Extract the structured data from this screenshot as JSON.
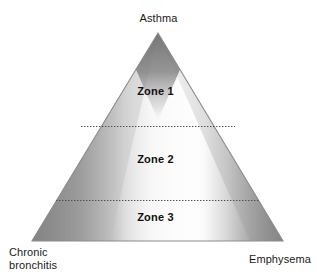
{
  "figure": {
    "shape": "triangle",
    "background_color": "#ffffff",
    "outline_color": "#8c8c8c",
    "divider_style": "dotted",
    "divider_color": "#4d4d4d"
  },
  "vertices": {
    "top": {
      "label": "Asthma",
      "position": "apex"
    },
    "bottom_left": {
      "label_line_1": "Chronic",
      "label_line_2": "bronchitis",
      "position": "bottom-left"
    },
    "bottom_right": {
      "label": "Emphysema",
      "position": "bottom-right"
    }
  },
  "zones": [
    {
      "id": "zone-1",
      "label": "Zone 1",
      "band": "top"
    },
    {
      "id": "zone-2",
      "label": "Zone 2",
      "band": "middle"
    },
    {
      "id": "zone-3",
      "label": "Zone 3",
      "band": "bottom"
    }
  ],
  "palette": {
    "dark_grey": "#8a8a8a",
    "mid_grey": "#b4b4b4",
    "light_grey": "#e6e6e6",
    "highlight": "#f4f4f4",
    "text": "#1a1a1a",
    "zone_text": "#101010"
  }
}
